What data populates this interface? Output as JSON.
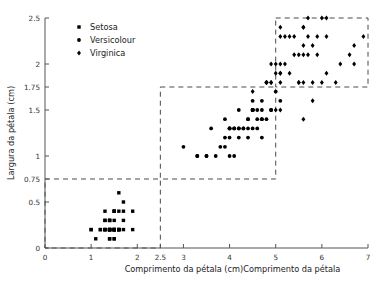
{
  "chart_data": {
    "type": "scatter",
    "title": "",
    "xlabel": "Comprimento da pétala (cm)Comprimento da pétala",
    "ylabel": "Largura da pétala (cm)",
    "xlim": [
      0,
      7
    ],
    "ylim": [
      0,
      2.5
    ],
    "xticks": [
      0,
      1,
      2,
      2.5,
      3,
      4,
      5,
      6,
      7
    ],
    "xticklabels": [
      "0",
      "1",
      "2",
      "2.5",
      "3",
      "4",
      "5",
      "6",
      "7"
    ],
    "yticks": [
      0,
      0.5,
      0.75,
      1,
      1.5,
      1.75,
      2,
      2.5
    ],
    "yticklabels": [
      "0",
      "0.5",
      "0.75",
      "1",
      "1.5",
      "1.75",
      "2",
      "2.5"
    ],
    "grid": false,
    "legend_position": "top-left",
    "marker_color": "#000000",
    "series": [
      {
        "name": "Setosa",
        "marker": "square",
        "points": [
          [
            1.0,
            0.2
          ],
          [
            1.4,
            0.2
          ],
          [
            1.3,
            0.2
          ],
          [
            1.5,
            0.2
          ],
          [
            1.4,
            0.2
          ],
          [
            1.7,
            0.4
          ],
          [
            1.4,
            0.3
          ],
          [
            1.5,
            0.2
          ],
          [
            1.4,
            0.2
          ],
          [
            1.5,
            0.1
          ],
          [
            1.5,
            0.2
          ],
          [
            1.6,
            0.2
          ],
          [
            1.4,
            0.1
          ],
          [
            1.1,
            0.1
          ],
          [
            1.2,
            0.2
          ],
          [
            1.5,
            0.4
          ],
          [
            1.3,
            0.4
          ],
          [
            1.4,
            0.3
          ],
          [
            1.7,
            0.3
          ],
          [
            1.5,
            0.3
          ],
          [
            1.7,
            0.2
          ],
          [
            1.5,
            0.4
          ],
          [
            1.0,
            0.2
          ],
          [
            1.7,
            0.5
          ],
          [
            1.9,
            0.2
          ],
          [
            1.6,
            0.2
          ],
          [
            1.6,
            0.4
          ],
          [
            1.5,
            0.2
          ],
          [
            1.4,
            0.2
          ],
          [
            1.6,
            0.2
          ],
          [
            1.6,
            0.2
          ],
          [
            1.5,
            0.4
          ],
          [
            1.5,
            0.1
          ],
          [
            1.4,
            0.2
          ],
          [
            1.5,
            0.2
          ],
          [
            1.2,
            0.2
          ],
          [
            1.3,
            0.2
          ],
          [
            1.4,
            0.1
          ],
          [
            1.3,
            0.2
          ],
          [
            1.5,
            0.2
          ],
          [
            1.3,
            0.3
          ],
          [
            1.3,
            0.3
          ],
          [
            1.3,
            0.2
          ],
          [
            1.6,
            0.6
          ],
          [
            1.9,
            0.4
          ],
          [
            1.4,
            0.3
          ],
          [
            1.6,
            0.2
          ],
          [
            1.4,
            0.2
          ],
          [
            1.5,
            0.2
          ],
          [
            1.4,
            0.2
          ]
        ]
      },
      {
        "name": "Versicolour",
        "marker": "circle",
        "points": [
          [
            4.7,
            1.4
          ],
          [
            4.5,
            1.5
          ],
          [
            4.9,
            1.5
          ],
          [
            4.0,
            1.3
          ],
          [
            4.6,
            1.5
          ],
          [
            4.5,
            1.3
          ],
          [
            4.7,
            1.6
          ],
          [
            3.3,
            1.0
          ],
          [
            4.6,
            1.3
          ],
          [
            3.9,
            1.4
          ],
          [
            3.5,
            1.0
          ],
          [
            4.2,
            1.5
          ],
          [
            4.0,
            1.0
          ],
          [
            4.7,
            1.4
          ],
          [
            3.6,
            1.3
          ],
          [
            4.4,
            1.4
          ],
          [
            4.5,
            1.5
          ],
          [
            4.1,
            1.0
          ],
          [
            4.5,
            1.5
          ],
          [
            3.9,
            1.1
          ],
          [
            4.8,
            1.8
          ],
          [
            4.0,
            1.3
          ],
          [
            4.9,
            1.5
          ],
          [
            4.7,
            1.2
          ],
          [
            4.3,
            1.3
          ],
          [
            4.4,
            1.4
          ],
          [
            4.8,
            1.4
          ],
          [
            5.0,
            1.7
          ],
          [
            4.5,
            1.5
          ],
          [
            3.5,
            1.0
          ],
          [
            3.8,
            1.1
          ],
          [
            3.7,
            1.0
          ],
          [
            3.9,
            1.2
          ],
          [
            5.1,
            1.6
          ],
          [
            4.5,
            1.5
          ],
          [
            4.5,
            1.6
          ],
          [
            4.7,
            1.5
          ],
          [
            4.4,
            1.3
          ],
          [
            4.1,
            1.3
          ],
          [
            4.0,
            1.3
          ],
          [
            4.4,
            1.2
          ],
          [
            4.6,
            1.4
          ],
          [
            4.0,
            1.2
          ],
          [
            3.3,
            1.0
          ],
          [
            4.2,
            1.3
          ],
          [
            4.2,
            1.2
          ],
          [
            4.2,
            1.3
          ],
          [
            4.3,
            1.3
          ],
          [
            3.0,
            1.1
          ],
          [
            4.1,
            1.3
          ]
        ]
      },
      {
        "name": "Virginica",
        "marker": "diamond",
        "points": [
          [
            6.0,
            2.5
          ],
          [
            5.1,
            1.9
          ],
          [
            5.9,
            2.1
          ],
          [
            5.6,
            1.8
          ],
          [
            5.8,
            2.2
          ],
          [
            6.6,
            2.1
          ],
          [
            4.5,
            1.7
          ],
          [
            6.3,
            1.8
          ],
          [
            5.8,
            1.8
          ],
          [
            6.1,
            2.5
          ],
          [
            5.1,
            2.0
          ],
          [
            5.3,
            1.9
          ],
          [
            5.5,
            2.1
          ],
          [
            5.0,
            2.0
          ],
          [
            5.1,
            2.4
          ],
          [
            5.3,
            2.3
          ],
          [
            5.5,
            1.8
          ],
          [
            6.7,
            2.2
          ],
          [
            6.9,
            2.3
          ],
          [
            5.0,
            1.5
          ],
          [
            5.7,
            2.3
          ],
          [
            4.9,
            2.0
          ],
          [
            6.7,
            2.0
          ],
          [
            4.9,
            1.8
          ],
          [
            5.7,
            2.1
          ],
          [
            6.0,
            1.8
          ],
          [
            4.8,
            1.8
          ],
          [
            4.9,
            1.8
          ],
          [
            5.6,
            2.1
          ],
          [
            5.8,
            1.6
          ],
          [
            6.1,
            1.9
          ],
          [
            6.4,
            2.0
          ],
          [
            5.6,
            2.2
          ],
          [
            5.1,
            1.5
          ],
          [
            5.6,
            1.4
          ],
          [
            6.1,
            2.3
          ],
          [
            5.6,
            2.4
          ],
          [
            5.5,
            1.8
          ],
          [
            4.8,
            1.8
          ],
          [
            5.4,
            2.1
          ],
          [
            5.6,
            2.4
          ],
          [
            5.1,
            2.3
          ],
          [
            5.1,
            1.9
          ],
          [
            5.9,
            2.3
          ],
          [
            5.7,
            2.5
          ],
          [
            5.2,
            2.3
          ],
          [
            5.0,
            1.9
          ],
          [
            5.2,
            2.0
          ],
          [
            5.4,
            2.3
          ],
          [
            5.1,
            1.8
          ]
        ]
      }
    ],
    "cluster_boxes": [
      {
        "label": "setosa-region",
        "x0": 0,
        "y0": 0,
        "x1": 2.5,
        "y1": 0.75
      },
      {
        "label": "versicolour-region",
        "x0": 2.5,
        "y0": 0.75,
        "x1": 5,
        "y1": 1.75
      },
      {
        "label": "virginica-region",
        "x0": 5,
        "y0": 1.75,
        "x1": 7,
        "y1": 2.5
      }
    ]
  },
  "legend": {
    "items": [
      {
        "label": "Setosa",
        "marker": "square"
      },
      {
        "label": "Versicolour",
        "marker": "circle"
      },
      {
        "label": "Virginica",
        "marker": "diamond"
      }
    ]
  }
}
